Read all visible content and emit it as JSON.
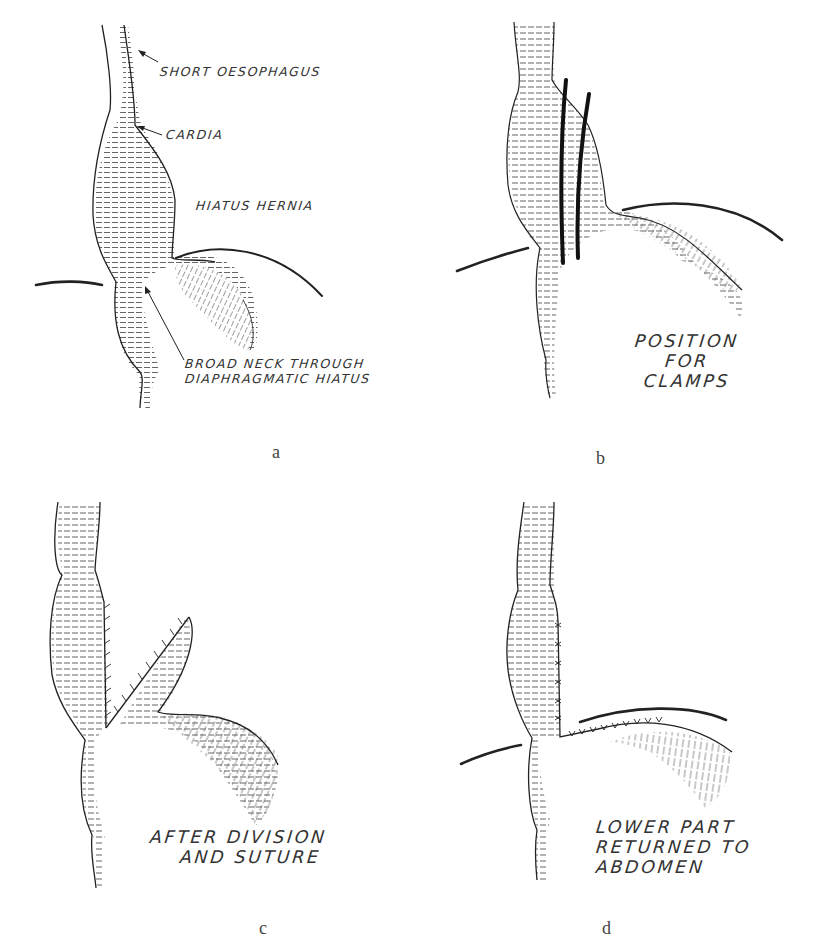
{
  "figure": {
    "panels": [
      {
        "id": "a",
        "caption": "a",
        "labels": {
          "short_oesophagus": "SHORT OESOPHAGUS",
          "cardia": "CARDIA",
          "hiatus_hernia": "HIATUS HERNIA",
          "broad_neck_line1": "BROAD NECK THROUGH",
          "broad_neck_line2": "DIAPHRAGMATIC HIATUS"
        }
      },
      {
        "id": "b",
        "caption": "b",
        "labels": {
          "line1": "POSITION",
          "line2": "FOR",
          "line3": "CLAMPS"
        }
      },
      {
        "id": "c",
        "caption": "c",
        "labels": {
          "line1": "AFTER DIVISION",
          "line2": "AND SUTURE"
        }
      },
      {
        "id": "d",
        "caption": "d",
        "labels": {
          "line1": "LOWER PART",
          "line2": "RETURNED TO",
          "line3": "ABDOMEN"
        }
      }
    ],
    "colors": {
      "ink": "#222222",
      "hatch": "#555555",
      "background": "#ffffff"
    }
  }
}
